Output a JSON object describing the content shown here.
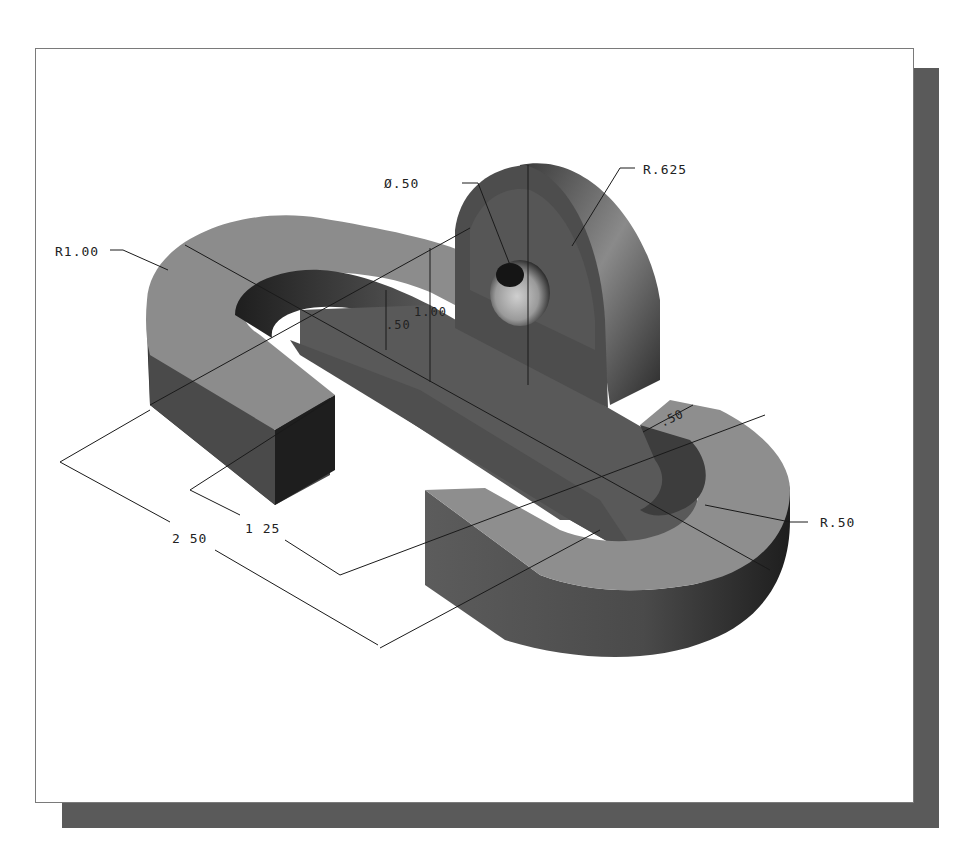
{
  "figure": {
    "type": "isometric-shaded-part-drawing",
    "frame_color": "#7a7a7a",
    "shadow_color": "#5a5a5a",
    "colors": {
      "top_face": "#8c8c8c",
      "side_face_dark": "#3c3c3c",
      "side_face_mid": "#5e5e5e",
      "end_face": "#1c1c1c",
      "hole": "#bdbdbd",
      "background": "#ffffff"
    }
  },
  "dimensions": {
    "hole_diameter": "Ø.50",
    "boss_radius": "R.625",
    "outer_radius_top": "R1.00",
    "slot_height": ".50",
    "boss_height": "1.00",
    "web_width": ".50",
    "inner_radius_bottom": "R.50",
    "length_overall": "2 50",
    "length_inner": "1 25"
  }
}
